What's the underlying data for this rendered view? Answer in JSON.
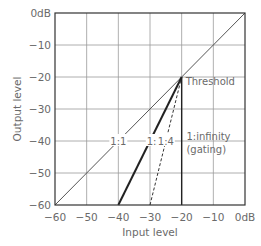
{
  "chart_data": {
    "type": "line",
    "title": "",
    "xlabel": "Input level",
    "ylabel": "Output level",
    "xlim": [
      -60,
      0
    ],
    "ylim": [
      -60,
      0
    ],
    "grid": true,
    "x_ticks": [
      "−60",
      "−50",
      "−40",
      "−30",
      "−20",
      "−10",
      "0dB"
    ],
    "y_ticks": [
      "0dB",
      "−10",
      "−20",
      "−30",
      "−40",
      "−50",
      "−60"
    ],
    "x_tick_values": [
      -60,
      -50,
      -40,
      -30,
      -20,
      -10,
      0
    ],
    "y_tick_values": [
      0,
      -10,
      -20,
      -30,
      -40,
      -50,
      -60
    ],
    "threshold": {
      "x": -20,
      "y": -20,
      "label": "Threshold"
    },
    "series": [
      {
        "name": "1:1",
        "label": "1:1",
        "style": "thin-solid",
        "x": [
          -60,
          0
        ],
        "y": [
          -60,
          0
        ],
        "label_at": [
          -40,
          -40
        ]
      },
      {
        "name": "1:2",
        "label": "1:2",
        "style": "thick-solid",
        "x": [
          -40,
          -20
        ],
        "y": [
          -60,
          -20
        ],
        "label_at": [
          -28.5,
          -40
        ]
      },
      {
        "name": "1:4",
        "label": "1:4",
        "style": "dashed",
        "x": [
          -30,
          -20
        ],
        "y": [
          -60,
          -20
        ],
        "label_at": [
          -25,
          -40
        ]
      },
      {
        "name": "1:infinity (gating)",
        "label": "1:infinity",
        "label2": "(gating)",
        "style": "medium-solid",
        "x": [
          -20,
          -20
        ],
        "y": [
          -60,
          -20
        ],
        "label_at": [
          -18.5,
          -40
        ]
      }
    ]
  }
}
